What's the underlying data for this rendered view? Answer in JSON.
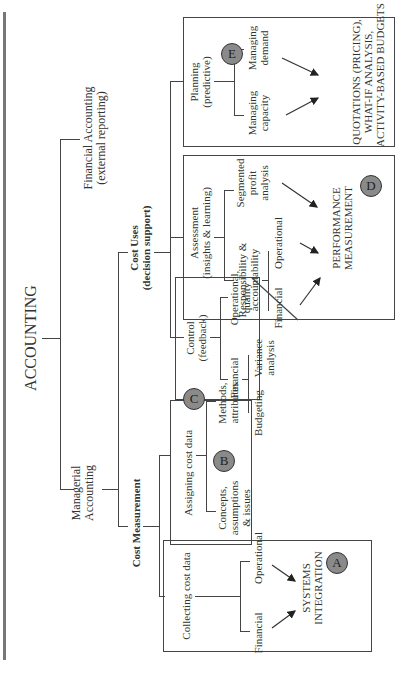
{
  "diagram": {
    "title": "ACCOUNTING",
    "branches": {
      "managerial": {
        "line1": "Managerial",
        "line2": "Accounting"
      },
      "financial": {
        "line1": "Financial Accounting",
        "line2": "(external reporting)"
      }
    },
    "cost_measurement": {
      "label": "Cost Measurement",
      "collecting": {
        "label": "Collecting cost data",
        "children": [
          "Financial",
          "Operational"
        ],
        "outcome_line1": "SYSTEMS",
        "outcome_line2": "INTEGRATION",
        "badge": "A"
      },
      "assigning": {
        "label": "Assigning cost data",
        "children": [
          {
            "line1": "Concepts,",
            "line2": "assumptions",
            "line3": "& issues"
          },
          {
            "line1": "Methods,",
            "line2": "attributes"
          }
        ],
        "badge": "B"
      }
    },
    "cost_uses": {
      "label_line1": "Cost Uses",
      "label_line2": "(decision support)",
      "control": {
        "label_line1": "Control",
        "label_line2": "(feedback)",
        "children": [
          "Financial",
          "Operational,",
          "quality"
        ],
        "sub_children": [
          "Budgeting",
          "Variance",
          "analysis"
        ],
        "badge": "C"
      },
      "assessment": {
        "label_line1": "Assessment",
        "label_line2": "(insights & learning)",
        "children": [
          {
            "line1": "Responsibility &",
            "line2": "accountability"
          },
          {
            "line1": "Segmented",
            "line2": "profit",
            "line3": "analysis"
          }
        ],
        "sub_children": [
          "Financial",
          "Operational"
        ],
        "outcome_line1": "PERFORMANCE",
        "outcome_line2": "MEASUREMENT",
        "badge": "D"
      },
      "planning": {
        "label_line1": "Planning",
        "label_line2": "(predictive)",
        "children": [
          {
            "line1": "Managing",
            "line2": "capacity"
          },
          {
            "line1": "Managing",
            "line2": "demand"
          }
        ],
        "outcome_line1": "QUOTATIONS (PRICING),",
        "outcome_line2": "WHAT-IF ANALYSIS,",
        "outcome_line3": "ACTIVITY-BASED BUDGETS",
        "badge": "E"
      }
    }
  }
}
